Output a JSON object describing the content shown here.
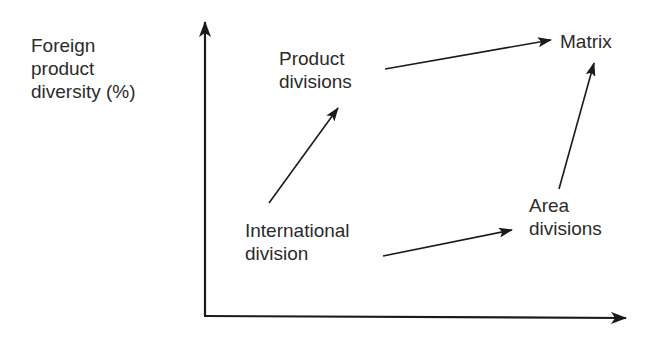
{
  "diagram": {
    "axes": {
      "y_axis_label": [
        "Foreign",
        "product",
        "diversity (%)"
      ],
      "x_axis_label": ""
    },
    "nodes": {
      "international_division": [
        "International",
        "division"
      ],
      "product_divisions": [
        "Product",
        "divisions"
      ],
      "area_divisions": [
        "Area",
        "divisions"
      ],
      "matrix": [
        "Matrix"
      ]
    },
    "edges": [
      {
        "from": "International division",
        "to": "Product divisions"
      },
      {
        "from": "International division",
        "to": "Area divisions"
      },
      {
        "from": "Product divisions",
        "to": "Matrix"
      },
      {
        "from": "Area divisions",
        "to": "Matrix"
      }
    ],
    "colors": {
      "ink": "#1a1a1a",
      "text": "#2b2b2b",
      "background": "#ffffff"
    }
  }
}
